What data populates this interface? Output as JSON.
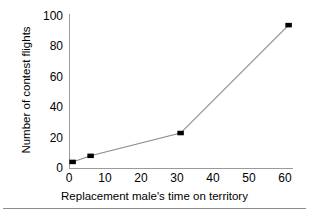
{
  "chart_data": {
    "type": "line",
    "title": "",
    "xlabel": "Replacement male's time on territory",
    "ylabel": "Number of contest flights",
    "x": [
      1,
      6,
      31,
      61
    ],
    "values": [
      4,
      8,
      23,
      94
    ],
    "series": [
      {
        "name": "Number of contest flights",
        "x": [
          1,
          6,
          31,
          61
        ],
        "values": [
          4,
          8,
          23,
          94
        ]
      }
    ],
    "xlim": [
      0,
      62
    ],
    "ylim": [
      0,
      100
    ],
    "xticks": [
      "0",
      "10",
      "20",
      "30",
      "40",
      "50",
      "60"
    ],
    "yticks": [
      "0",
      "20",
      "40",
      "60",
      "80",
      "100"
    ],
    "xtick_values": [
      0,
      10,
      20,
      30,
      40,
      50,
      60
    ],
    "ytick_values": [
      0,
      20,
      40,
      60,
      80,
      100
    ],
    "grid": false,
    "legend": false,
    "legend_position": "none",
    "marker": "square",
    "marker_color": "#000000",
    "line_color": "#8a8a8a",
    "axis_color": "#9a9a9a",
    "background": "#ffffff"
  }
}
